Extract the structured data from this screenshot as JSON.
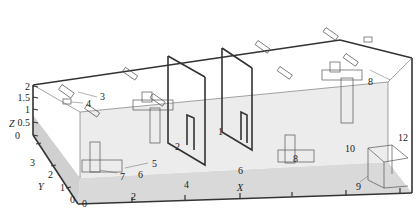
{
  "diagram": {
    "type": "3d-room-geometry",
    "axes": {
      "x": {
        "label": "X",
        "ticks": [
          "0",
          "2",
          "4",
          "6",
          "8",
          "10",
          "12"
        ]
      },
      "y": {
        "label": "Y",
        "ticks": [
          "0",
          "1",
          "2",
          "3"
        ]
      },
      "z": {
        "label": "Z",
        "ticks": [
          "0",
          "0.5",
          "1",
          "1.5",
          "2"
        ]
      }
    },
    "callouts": [
      "1",
      "2",
      "3",
      "4",
      "5",
      "6",
      "7",
      "8",
      "9"
    ],
    "colors": {
      "floor": "#d4d4d4",
      "back_wall": "#e6e6e6",
      "edge": "#333333"
    }
  }
}
